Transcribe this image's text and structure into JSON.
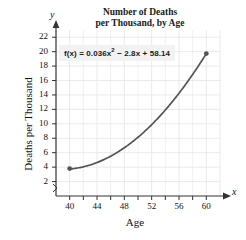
{
  "chart_data": {
    "type": "line",
    "title": "Number of Deaths per Thousand, by Age",
    "title_lines": [
      "Number of Deaths",
      "per Thousand, by Age"
    ],
    "xlabel": "Age",
    "ylabel": "Deaths per Thousand",
    "x_axis_name": "x",
    "y_axis_name": "y",
    "equation": "f(x) = 0.036x² − 2.8x + 58.14",
    "equation_parts": {
      "lhs": "f(x)",
      "equals": "=",
      "a_term": "0.036x",
      "a_exp": "2",
      "b_term": "− 2.8x",
      "c_term": "+ 58.14"
    },
    "function": {
      "a": 0.036,
      "b": -2.8,
      "c": 58.14
    },
    "xlim": [
      38,
      62
    ],
    "ylim": [
      0,
      23
    ],
    "xticks": [
      40,
      42,
      44,
      46,
      48,
      50,
      52,
      54,
      56,
      58,
      60
    ],
    "xtick_labels": [
      "40",
      "",
      "44",
      "",
      "48",
      "",
      "52",
      "",
      "56",
      "",
      "60"
    ],
    "yticks": [
      2,
      4,
      6,
      8,
      10,
      12,
      14,
      16,
      18,
      20,
      22
    ],
    "ytick_labels": [
      "2",
      "4",
      "6",
      "8",
      "10",
      "12",
      "14",
      "16",
      "18",
      "20",
      "22"
    ],
    "grid": true,
    "legend": false,
    "axis_break": true,
    "series": [
      {
        "name": "Deaths per Thousand",
        "x": [
          40,
          41,
          42,
          43,
          44,
          45,
          46,
          47,
          48,
          49,
          50,
          51,
          52,
          53,
          54,
          55,
          56,
          57,
          58,
          59,
          60
        ],
        "values": [
          3.74,
          3.68,
          3.7,
          3.79,
          3.96,
          4.19,
          4.5,
          4.88,
          5.34,
          5.87,
          6.47,
          7.15,
          7.89,
          8.72,
          9.61,
          10.58,
          11.62,
          12.73,
          13.92,
          15.18,
          16.51
        ]
      }
    ],
    "endpoints": [
      {
        "label": "left-endpoint",
        "x": 40,
        "y": 3.8
      },
      {
        "label": "right-endpoint",
        "x": 60,
        "y": 19.74
      }
    ],
    "colors": {
      "curve": "#555555",
      "grid": "#e8e8e8",
      "axis": "#333333",
      "text": "#111111",
      "equation_background": "#f2f2f2"
    }
  }
}
